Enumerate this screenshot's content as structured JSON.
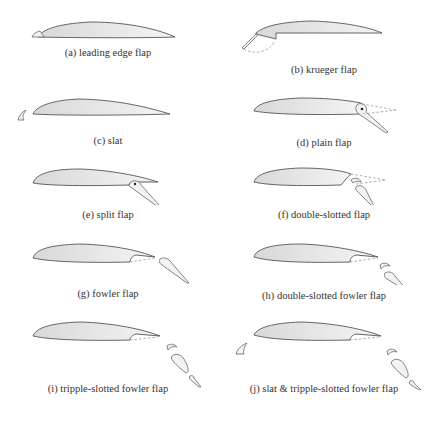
{
  "figure": {
    "panels": [
      {
        "id": "a",
        "caption": "(a) leading edge flap"
      },
      {
        "id": "b",
        "caption": "(b) krueger flap"
      },
      {
        "id": "c",
        "caption": "(c) slat"
      },
      {
        "id": "d",
        "caption": "(d) plain flap"
      },
      {
        "id": "e",
        "caption": "(e) split flap"
      },
      {
        "id": "f",
        "caption": "(f) double-slotted flap"
      },
      {
        "id": "g",
        "caption": "(g) fowler flap"
      },
      {
        "id": "h",
        "caption": "(h) double-slotted fowler flap"
      },
      {
        "id": "i",
        "caption": "(i) tripple-slotted fowler flap"
      },
      {
        "id": "j",
        "caption": "(j) slat & tripple-slotted fowler flap"
      }
    ],
    "footer_caption": "",
    "colors": {
      "outline": "#555555",
      "fill_light": "#f4f4f4",
      "fill_dark": "#d8d8d8",
      "text": "#333333"
    }
  }
}
